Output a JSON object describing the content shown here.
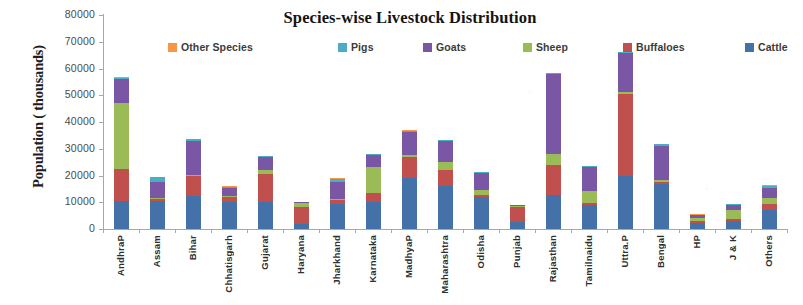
{
  "chart_data": {
    "type": "bar",
    "stacked": true,
    "title": "Species-wise Livestock Distribution",
    "xlabel": "",
    "ylabel": "Population ( thousands)",
    "ylim": [
      0,
      80000
    ],
    "ytick_values": [
      0,
      10000,
      20000,
      30000,
      40000,
      50000,
      60000,
      70000,
      80000
    ],
    "ytick_labels": [
      "0",
      "10000",
      "20000",
      "30000",
      "40000",
      "50000",
      "60000",
      "70000",
      "80000"
    ],
    "grid": false,
    "legend_position": "top",
    "legend_order": [
      "Other Species",
      "Pigs",
      "Goats",
      "Sheep",
      "Buffaloes",
      "Cattle"
    ],
    "stack_order_bottom_to_top": [
      "Cattle",
      "Buffaloes",
      "Sheep",
      "Goats",
      "Pigs",
      "Other Species"
    ],
    "categories": [
      "AndhraP",
      "Assam",
      "Bihar",
      "Chhatisgarh",
      "Gujarat",
      "Haryana",
      "Jharkhand",
      "Karnataka",
      "MadhyaP",
      "Maharashtra",
      "Odisha",
      "Punjab",
      "Rajasthan",
      "Tamilnaidu",
      "Uttra.P",
      "Bengal",
      "HP",
      "J & K",
      "Others"
    ],
    "series": [
      {
        "name": "Cattle",
        "color": "#4472a8",
        "values": [
          10500,
          10400,
          12500,
          10000,
          10000,
          1900,
          9500,
          10000,
          19000,
          16000,
          12000,
          2500,
          12600,
          9000,
          20000,
          17000,
          2200,
          3000,
          7000
        ]
      },
      {
        "name": "Buffaloes",
        "color": "#c0504d",
        "values": [
          12000,
          700,
          7500,
          2000,
          10500,
          6200,
          1300,
          3500,
          8100,
          6000,
          700,
          5800,
          11400,
          600,
          30600,
          700,
          700,
          700,
          2500
        ]
      },
      {
        "name": "Sheep",
        "color": "#9bbb59",
        "values": [
          24500,
          400,
          300,
          300,
          1700,
          1600,
          600,
          9500,
          500,
          3000,
          1800,
          300,
          4000,
          4500,
          700,
          600,
          1100,
          3300,
          2200
        ]
      },
      {
        "name": "Goats",
        "color": "#7a57a4",
        "values": [
          9000,
          6000,
          12600,
          3200,
          4800,
          300,
          6100,
          4700,
          8800,
          8000,
          6300,
          300,
          30000,
          9200,
          14500,
          12600,
          1200,
          2000,
          3500
        ]
      },
      {
        "name": "Pigs",
        "color": "#4bacc6",
        "values": [
          600,
          1900,
          600,
          400,
          200,
          100,
          1300,
          300,
          400,
          300,
          600,
          100,
          200,
          200,
          300,
          800,
          200,
          300,
          1000
        ]
      },
      {
        "name": "Other Species",
        "color": "#f79646",
        "values": [
          200,
          100,
          100,
          100,
          100,
          100,
          100,
          100,
          100,
          100,
          100,
          100,
          100,
          100,
          200,
          100,
          100,
          100,
          300
        ]
      }
    ]
  },
  "legend": {
    "items": [
      {
        "label": "Other Species",
        "color": "#f79646"
      },
      {
        "label": "Pigs",
        "color": "#4bacc6"
      },
      {
        "label": "Goats",
        "color": "#7a57a4"
      },
      {
        "label": "Sheep",
        "color": "#9bbb59"
      },
      {
        "label": "Buffaloes",
        "color": "#c0504d"
      },
      {
        "label": "Cattle",
        "color": "#4472a8"
      }
    ]
  }
}
